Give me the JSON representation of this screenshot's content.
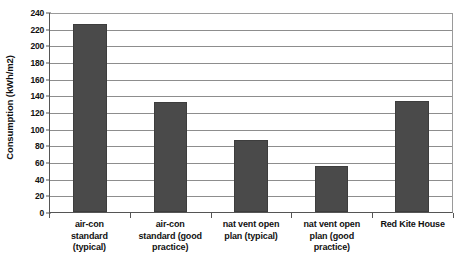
{
  "chart_data": {
    "type": "bar",
    "title": "",
    "xlabel": "",
    "ylabel": "Consumption (kWh/m2)",
    "ylim": [
      0,
      240
    ],
    "ytick_step": 20,
    "yticks": [
      240,
      220,
      200,
      180,
      160,
      140,
      120,
      100,
      80,
      60,
      40,
      20,
      0
    ],
    "grid": true,
    "legend": false,
    "categories": [
      "air-con standard (typical)",
      "air-con standard (good practice)",
      "nat vent open plan (typical)",
      "nat vent open plan (good practice)",
      "Red Kite House"
    ],
    "category_lines": [
      [
        "air-con",
        "standard",
        "(typical)"
      ],
      [
        "air-con",
        "standard (good",
        "practice)"
      ],
      [
        "nat vent open",
        "plan (typical)"
      ],
      [
        "nat vent open",
        "plan (good",
        "practice)"
      ],
      [
        "Red Kite House"
      ]
    ],
    "values": [
      226,
      132,
      86,
      55,
      133
    ],
    "bar_color": "#4a4a4a",
    "gridline_color": "#8d8d8d",
    "axis_color": "#555555",
    "background_color": "#ffffff"
  }
}
